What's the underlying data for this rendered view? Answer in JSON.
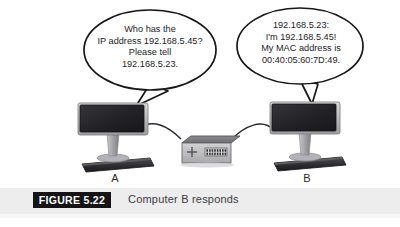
{
  "figure": {
    "tag": "FIGURE 5.22",
    "caption": "Computer B responds"
  },
  "nodes": {
    "computer_a_label": "A",
    "computer_b_label": "B"
  },
  "bubbles": {
    "request": {
      "speaker": "A",
      "text": "Who has the\nIP address 192.168.5.45?\nPlease tell\n192.168.5.23."
    },
    "reply": {
      "speaker": "B",
      "text": "192.168.5.23:\nI'm 192.168.5.45!\nMy MAC address is\n00:40:05:60:7D:49."
    }
  },
  "colors": {
    "background": "#ffffff",
    "caption_band": "#ededee",
    "figure_tag_bg": "#141414",
    "figure_tag_text": "#ffffff",
    "caption_text": "#3a3a3c",
    "ink": "#1d1d1f",
    "screen_dark": "#242427",
    "device_gray": "#b8b8ba",
    "device_gray_dark": "#6f6f73"
  }
}
